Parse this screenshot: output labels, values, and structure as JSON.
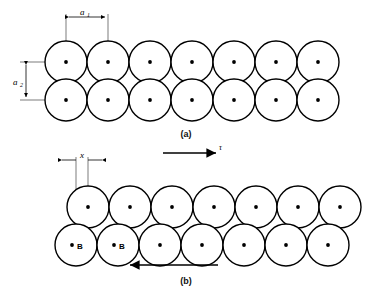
{
  "figure": {
    "panels": [
      {
        "id": "a",
        "caption": "(a)",
        "description": "Square-packed circle array, two rows aligned in columns",
        "rows": 2,
        "columns": 7,
        "circle_radius": 21,
        "row_top_center_y": 62,
        "row_bottom_center_y": 100,
        "first_center_x": 66,
        "pitch_x": 42,
        "row_offset_x": 0,
        "dimensions": [
          {
            "name": "a1",
            "label": "a",
            "subscript": "1",
            "orientation": "horizontal",
            "from_x": 66,
            "to_x": 108,
            "y": 17,
            "meaning": "horizontal centre-to-centre spacing"
          },
          {
            "name": "a2",
            "label": "a",
            "subscript": "2",
            "orientation": "vertical",
            "from_y": 62,
            "to_y": 100,
            "x": 26,
            "meaning": "vertical centre-to-centre spacing"
          }
        ]
      },
      {
        "id": "b",
        "caption": "(b)",
        "description": "Sheared circle array, bottom row displaced by x",
        "rows": 2,
        "columns": 7,
        "circle_radius": 21,
        "row_top_center_y": 207,
        "row_bottom_center_y": 245,
        "first_center_x": 88,
        "pitch_x": 42,
        "row_offset_x": -12,
        "dimensions": [
          {
            "name": "x",
            "label": "x",
            "subscript": "",
            "orientation": "horizontal",
            "from_x": 76,
            "to_x": 88,
            "y": 160,
            "meaning": "shear displacement of lower row"
          }
        ],
        "shear_arrows": [
          {
            "name": "tau-top",
            "direction": "right",
            "label": "τ",
            "from_x": 163,
            "to_x": 218,
            "y": 153
          },
          {
            "name": "tau-bottom",
            "direction": "left",
            "label": "",
            "from_x": 218,
            "to_x": 128,
            "y": 265
          }
        ],
        "marked_circles": [
          {
            "name": "circle-b-1",
            "label": "B",
            "center_x": 76,
            "center_y": 245
          },
          {
            "name": "circle-b-2",
            "label": "B",
            "center_x": 118,
            "center_y": 245
          }
        ]
      }
    ]
  },
  "labels": {
    "caption_a": "(a)",
    "caption_b": "(b)",
    "dim_a1_base": "a",
    "dim_a1_sub": "1",
    "dim_a2_base": "a",
    "dim_a2_sub": "2",
    "dim_x": "x",
    "tau": "τ",
    "marker_b_first": "B",
    "marker_b_second": "B"
  },
  "colors": {
    "stroke": "#000000",
    "fill": "#ffffff",
    "background": "#ffffff",
    "caption": "#111111"
  }
}
